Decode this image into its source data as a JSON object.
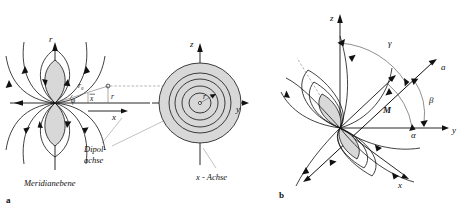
{
  "figure": {
    "type": "scientific-diagram",
    "background_color": "#ffffff",
    "line_color": "#111111",
    "lobe_fill_color": "#d8d8d8",
    "width": 471,
    "height": 212
  },
  "panel_a": {
    "panel_label": "a",
    "caption": "Meridianebene",
    "meridian_plane": {
      "vertical_axis_label": "r",
      "horizontal_axis_label": "",
      "angle_label": "φ",
      "radius_outer_label": "r₀",
      "radius_label": "r",
      "coordinate_label_x_bar": "x",
      "axis_label_x": "x",
      "dipole_axis_label_line1": "Dipol-",
      "dipole_axis_label_line2": "achse"
    },
    "cross_section": {
      "vertical_axis_label": "z",
      "horizontal_axis_label": "y",
      "radius_label": "r",
      "x_axis_callout": "x - Achse"
    }
  },
  "panel_b": {
    "panel_label": "b",
    "axes": [
      {
        "name": "z-axis",
        "label": "z"
      },
      {
        "name": "y-axis",
        "label": "y"
      },
      {
        "name": "x-axis",
        "label": "x"
      }
    ],
    "vectors": [
      {
        "name": "dipole-moment",
        "label": "M"
      },
      {
        "name": "direction-vector",
        "label": "a"
      }
    ],
    "angles": [
      {
        "name": "angle-alpha",
        "label": "α"
      },
      {
        "name": "angle-beta",
        "label": "β"
      },
      {
        "name": "angle-gamma",
        "label": "γ"
      }
    ]
  }
}
